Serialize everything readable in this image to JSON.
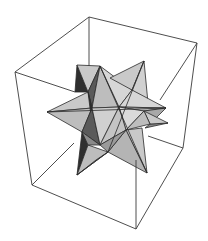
{
  "figure": {
    "title": "Small stellated dodecahedron in bounding box",
    "background": "#ffffff",
    "box": {
      "stroke": "#3a3a3a",
      "back_top": [
        89,
        17
      ],
      "right_top": [
        197,
        43
      ],
      "left_top": [
        15,
        72
      ],
      "front_top_hidden": [
        123,
        98
      ],
      "back_bottom": [
        70,
        130
      ],
      "right_bottom": [
        183,
        148
      ],
      "left_bottom": [
        32,
        185
      ],
      "front_bottom": [
        136,
        229
      ]
    },
    "shading": {
      "light": "#d6d6d6",
      "mid": "#bdbdbd",
      "midlight": "#c9c9c9",
      "dark": "#8a8a8a",
      "darker": "#5a5a5a",
      "darkest": "#2f2f2f"
    }
  }
}
